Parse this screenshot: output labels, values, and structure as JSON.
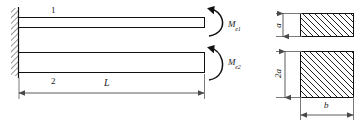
{
  "figure": {
    "type": "engineering-mechanics-diagram",
    "ink_color": "#111111",
    "dimension_color": "#4a4a4a",
    "background": "#ffffff"
  },
  "beams": {
    "upper": {
      "label": "1",
      "moment_label": "M",
      "moment_subscript": "e1"
    },
    "lower": {
      "label": "2",
      "moment_label": "M",
      "moment_subscript": "e2"
    }
  },
  "dimensions": {
    "length": "L"
  },
  "cross_sections": {
    "upper": {
      "height_label": "a"
    },
    "lower": {
      "height_label": "2a",
      "width_label": "b"
    }
  }
}
